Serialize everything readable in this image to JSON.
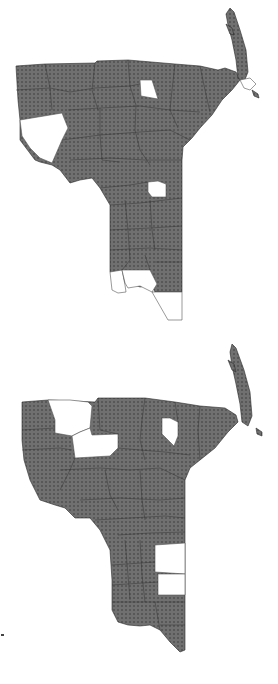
{
  "figure": {
    "type": "choropleth-map-pair",
    "panels": 2,
    "colors": {
      "shaded_fill": "#6e6e6e",
      "dot_color": "#3a3a3a",
      "unshaded_fill": "#ffffff",
      "border": "#2a2a2a",
      "background": "#ffffff"
    },
    "legend": null,
    "text_labels": []
  },
  "maps": [
    {
      "id": "top",
      "description": "Upper map: most counties shaded (dotted gray); unshaded counties are the far-west wedge, one north-central square, one central square, and the southern tip counties",
      "unshaded_regions": [
        "west-wedge",
        "north-central-square",
        "central-square",
        "south-tip-west",
        "south-tip-middle",
        "south-tip-east"
      ]
    },
    {
      "id": "bottom",
      "description": "Lower map: most counties shaded (dotted gray); unshaded counties are two northwest counties, one north-central county, and two stacked counties on the southeast edge",
      "unshaded_regions": [
        "northwest-upper",
        "northwest-lower",
        "north-central",
        "southeast-upper",
        "southeast-lower"
      ]
    }
  ]
}
